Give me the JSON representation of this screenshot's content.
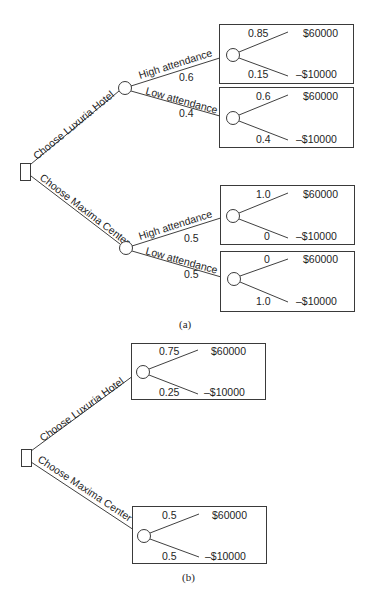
{
  "figure_a": {
    "caption": "(a)",
    "decision_branches": [
      "Choose Luxuria Hotel",
      "Choose Maxima Center"
    ],
    "luxuria": {
      "high": {
        "label": "High attendance",
        "prob": "0.6",
        "win_prob": "0.85",
        "lose_prob": "0.15"
      },
      "low": {
        "label": "Low attendance",
        "prob": "0.4",
        "win_prob": "0.6",
        "lose_prob": "0.4"
      }
    },
    "maxima": {
      "high": {
        "label": "High attendance",
        "prob": "0.5",
        "win_prob": "1.0",
        "lose_prob": "0"
      },
      "low": {
        "label": "Low attendance",
        "prob": "0.5",
        "win_prob": "0",
        "lose_prob": "1.0"
      }
    }
  },
  "figure_b": {
    "caption": "(b)",
    "decision_branches": [
      "Choose Luxuria Hotel",
      "Choose Maxima Center"
    ],
    "luxuria": {
      "win_prob": "0.75",
      "lose_prob": "0.25"
    },
    "maxima": {
      "win_prob": "0.5",
      "lose_prob": "0.5"
    }
  },
  "payoffs": {
    "win": "$60000",
    "lose": "–$10000"
  }
}
